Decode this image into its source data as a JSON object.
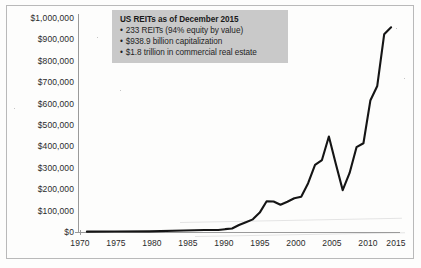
{
  "chart_data": {
    "type": "line",
    "title": "",
    "xlabel": "",
    "ylabel": "",
    "xlim": [
      1970,
      2016
    ],
    "ylim": [
      0,
      1000000
    ],
    "grid": false,
    "legend_position": "none",
    "y_tick_labels": [
      "$1,000,000",
      "$900,000",
      "$800,000",
      "$700,000",
      "$600,000",
      "$500,000",
      "$400,000",
      "$300,000",
      "$200,000",
      "$100,000",
      "$0"
    ],
    "y_tick_values": [
      1000000,
      900000,
      800000,
      700000,
      600000,
      500000,
      400000,
      300000,
      200000,
      100000,
      0
    ],
    "x_tick_labels": [
      "1970",
      "1975",
      "1980",
      "1985",
      "1990",
      "1995",
      "2000",
      "2005",
      "2010",
      "2015"
    ],
    "x_tick_values": [
      1970,
      1975,
      1980,
      1985,
      1990,
      1995,
      2000,
      2005,
      2010,
      2015
    ],
    "series": [
      {
        "name": "US REIT market capitalization",
        "x": [
          1971,
          1975,
          1980,
          1985,
          1988,
          1990,
          1991,
          1992,
          1993,
          1994,
          1995,
          1996,
          1997,
          1998,
          1999,
          2000,
          2001,
          2002,
          2003,
          2004,
          2005,
          2006,
          2007,
          2008,
          2009,
          2010,
          2011,
          2012,
          2013,
          2014,
          2015
        ],
        "y": [
          1500,
          2000,
          3000,
          7000,
          9000,
          9000,
          13000,
          16000,
          32000,
          45000,
          58000,
          89000,
          141000,
          140000,
          125000,
          139000,
          155000,
          162000,
          224000,
          308000,
          330000,
          438000,
          313000,
          192000,
          271000,
          389000,
          407000,
          603000,
          670000,
          907000,
          939000
        ]
      }
    ],
    "annotation": {
      "title": "US REITs as of December 2015",
      "bullets": [
        "233 REITs (94% equity by value)",
        "$938.9 billion capitalization",
        "$1.8 trillion in commercial real estate"
      ],
      "background_color": "#c9c9c9"
    },
    "line_color": "#151515",
    "axis_color": "#9a9a9a"
  }
}
